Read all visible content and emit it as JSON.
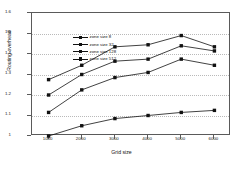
{
  "chart_data": {
    "type": "line",
    "title": "",
    "xlabel": "Grid size",
    "ylabel": "Routing overhead",
    "x": [
      1000,
      2000,
      3000,
      4000,
      5000,
      6000
    ],
    "xtick_labels": [
      "1000",
      "2000",
      "3000",
      "4000",
      "5000",
      "6000"
    ],
    "ytick_labels": [
      "1",
      "1.1",
      "1.2",
      "1.3",
      "1.4",
      "1.5",
      "1.6"
    ],
    "ytick_values": [
      1,
      1.1,
      1.2,
      1.3,
      1.4,
      1.5,
      1.6
    ],
    "xlim": [
      500,
      6500
    ],
    "ylim": [
      1.0,
      1.6
    ],
    "grid": "horizontal-dotted",
    "legend_position": "top-left-inside",
    "marker": "square",
    "line_color": "#111111",
    "series": [
      {
        "name": "zone size 8",
        "values": [
          1.0,
          1.05,
          1.085,
          1.1,
          1.115,
          1.125
        ]
      },
      {
        "name": "zone size 32",
        "values": [
          1.115,
          1.225,
          1.285,
          1.31,
          1.375,
          1.345
        ]
      },
      {
        "name": "zone size 128",
        "values": [
          1.2,
          1.3,
          1.365,
          1.375,
          1.44,
          1.415
        ]
      },
      {
        "name": "zone size 512",
        "values": [
          1.275,
          1.345,
          1.435,
          1.445,
          1.49,
          1.435
        ]
      }
    ]
  }
}
